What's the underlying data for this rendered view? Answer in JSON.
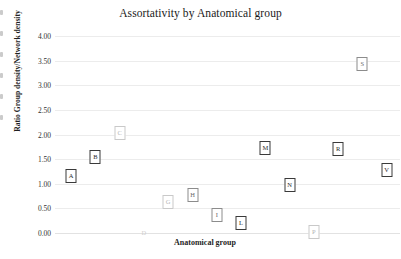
{
  "chart_data": {
    "type": "scatter",
    "title": "Assortativity by Anatomical group",
    "xlabel": "Anatomical group",
    "ylabel": "Ratio Group density/Network density",
    "ylim": [
      0.0,
      4.0
    ],
    "ytick_labels": [
      "4.00",
      "3.50",
      "3.00",
      "2.50",
      "2.00",
      "1.50",
      "1.00",
      "0.50",
      "0.00"
    ],
    "ytick_values": [
      4.0,
      3.5,
      3.0,
      2.5,
      2.0,
      1.5,
      1.0,
      0.5,
      0.0
    ],
    "xtick_labels": [],
    "grid": true,
    "legend": "none",
    "point_style": "letter-in-box",
    "categories": [
      "A",
      "B",
      "C",
      "D",
      "G",
      "H",
      "I",
      "L",
      "M",
      "N",
      "P",
      "R",
      "S",
      "V"
    ],
    "values": [
      1.15,
      1.55,
      2.03,
      0.0,
      0.63,
      0.78,
      0.37,
      0.21,
      1.72,
      0.98,
      0.02,
      1.7,
      3.43,
      1.28
    ],
    "points": [
      {
        "label": "A",
        "x": 1,
        "y": 1.15,
        "tone": "dark"
      },
      {
        "label": "B",
        "x": 2,
        "y": 1.55,
        "tone": "dark"
      },
      {
        "label": "C",
        "x": 3,
        "y": 2.03,
        "tone": "light"
      },
      {
        "label": "D",
        "x": 4,
        "y": 0.0,
        "tone": "ghost"
      },
      {
        "label": "G",
        "x": 5,
        "y": 0.63,
        "tone": "light"
      },
      {
        "label": "H",
        "x": 6,
        "y": 0.78,
        "tone": "mid"
      },
      {
        "label": "I",
        "x": 7,
        "y": 0.37,
        "tone": "mid"
      },
      {
        "label": "L",
        "x": 8,
        "y": 0.21,
        "tone": "dark"
      },
      {
        "label": "M",
        "x": 9,
        "y": 1.72,
        "tone": "dark"
      },
      {
        "label": "N",
        "x": 10,
        "y": 0.98,
        "tone": "dark"
      },
      {
        "label": "P",
        "x": 11,
        "y": 0.02,
        "tone": "light"
      },
      {
        "label": "R",
        "x": 12,
        "y": 1.7,
        "tone": "dark"
      },
      {
        "label": "S",
        "x": 13,
        "y": 3.43,
        "tone": "mid"
      },
      {
        "label": "V",
        "x": 14,
        "y": 1.28,
        "tone": "dark"
      }
    ],
    "colors": {
      "background": "#ffffff",
      "grid": "#ececec",
      "text": "#1a1a1a",
      "marker_dark": "#3a3a3a",
      "marker_mid": "#8c8c8c",
      "marker_light": "#c9c9c9"
    }
  }
}
